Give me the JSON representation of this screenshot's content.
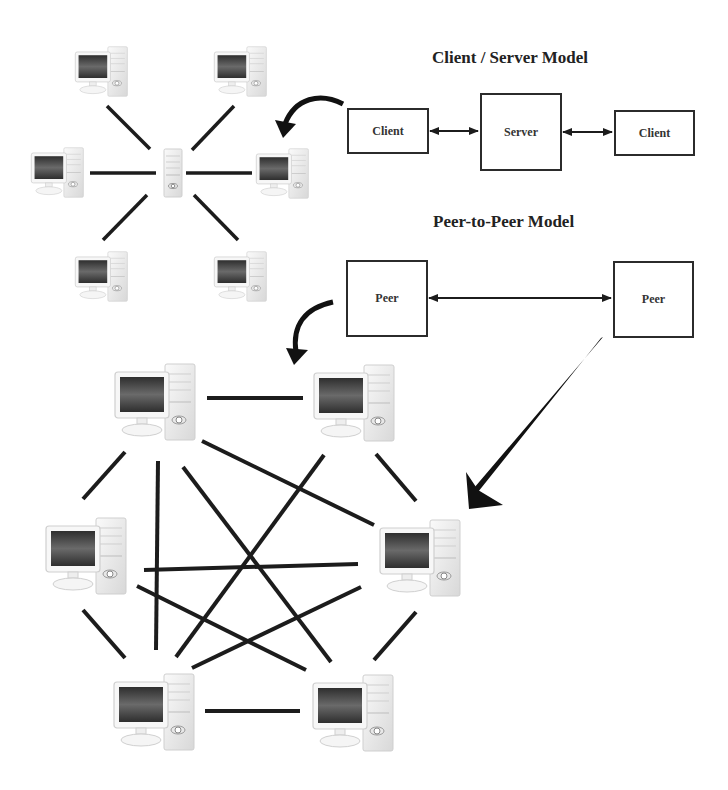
{
  "client_server": {
    "title": "Client / Server Model",
    "boxes": [
      {
        "label": "Client"
      },
      {
        "label": "Server"
      },
      {
        "label": "Client"
      }
    ]
  },
  "peer_to_peer": {
    "title": "Peer-to-Peer Model",
    "boxes": [
      {
        "label": "Peer"
      },
      {
        "label": "Peer"
      }
    ]
  },
  "star_topology": {
    "center": "server-tower",
    "node_count": 6
  },
  "mesh_topology": {
    "node_count": 6
  },
  "colors": {
    "line": "#1c1c1c",
    "box_border": "#2b2b2b",
    "screen_dark": "#3a3a3a",
    "computer_body": "#f2f2f2"
  }
}
